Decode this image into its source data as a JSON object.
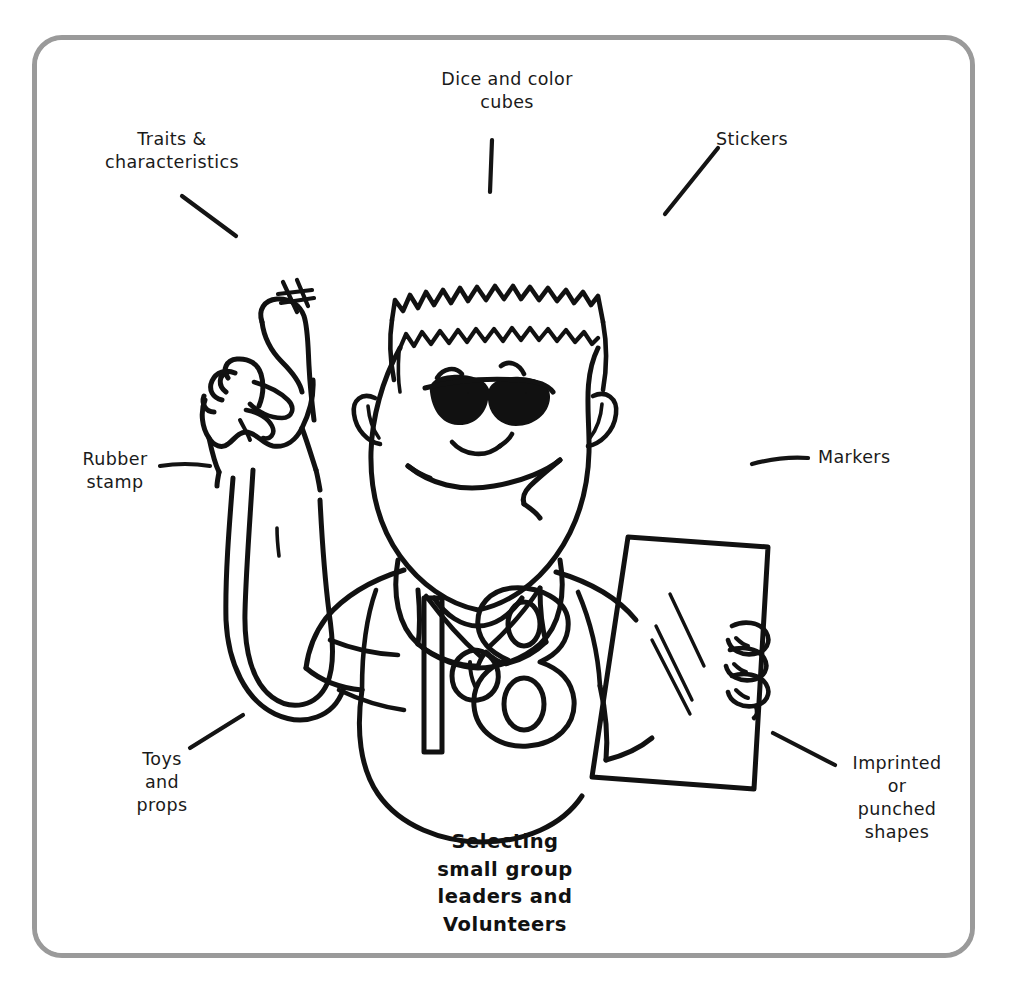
{
  "page": {
    "width": 1010,
    "height": 988,
    "background_color": "#ffffff",
    "ink_color": "#111111",
    "frame_color": "#9a9a9a",
    "type": "line-art illustration with callout labels"
  },
  "caption": {
    "text": "Selecting\nsmall group\nleaders and\nVolunteers"
  },
  "labels": [
    {
      "id": "traits",
      "text": "Traits &\ncharacteristics",
      "align": "center",
      "x": 87,
      "y": 128,
      "width": 170
    },
    {
      "id": "dice",
      "text": "Dice and color\ncubes",
      "align": "center",
      "x": 412,
      "y": 68,
      "width": 190
    },
    {
      "id": "stickers",
      "text": "Stickers",
      "align": "center",
      "x": 692,
      "y": 128,
      "width": 120
    },
    {
      "id": "rubber",
      "text": "Rubber\nstamp",
      "align": "center",
      "x": 56,
      "y": 448,
      "width": 118
    },
    {
      "id": "markers",
      "text": "Markers",
      "align": "left",
      "x": 818,
      "y": 446,
      "width": 120
    },
    {
      "id": "toys",
      "text": "Toys\nand\nprops",
      "align": "center",
      "x": 110,
      "y": 748,
      "width": 104
    },
    {
      "id": "imprinted",
      "text": "Imprinted\nor\npunched\nshapes",
      "align": "center",
      "x": 832,
      "y": 752,
      "width": 130
    }
  ],
  "leader_lines": [
    {
      "id": "leader-traits",
      "d": "M182 196 L236 236"
    },
    {
      "id": "leader-dice",
      "d": "M492 140 L490 192"
    },
    {
      "id": "leader-stickers",
      "d": "M718 148 L665 214"
    },
    {
      "id": "leader-rubber",
      "d": "M160 466 Q185 462 210 466"
    },
    {
      "id": "leader-markers",
      "d": "M752 464 Q782 456 808 458"
    },
    {
      "id": "leader-toys",
      "d": "M190 748 L243 715"
    },
    {
      "id": "leader-imprinted",
      "d": "M773 733 L835 765"
    }
  ],
  "illustration": {
    "subject": "cartoon man wearing sunglasses, crew-cut hair, jersey numbered 18 with a whistle, pointing up with left hand and holding a sheet of paper in right hand",
    "jersey_number": "18",
    "hand_mark": "#"
  }
}
